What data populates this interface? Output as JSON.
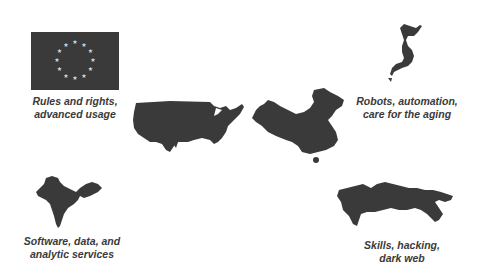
{
  "regions": [
    {
      "id": "eu",
      "symbol": "flag",
      "label": "Rules and rights,\nadvanced usage"
    },
    {
      "id": "usa",
      "symbol": "map",
      "label": ""
    },
    {
      "id": "china",
      "symbol": "map",
      "label": ""
    },
    {
      "id": "japan",
      "symbol": "map",
      "label": "Robots, automation,\ncare for the aging"
    },
    {
      "id": "india",
      "symbol": "map",
      "label": "Software, data, and\nanalytic services"
    },
    {
      "id": "russia",
      "symbol": "map",
      "label": "Skills, hacking,\ndark web"
    }
  ],
  "colors": {
    "shape_fill": "#3a3a3a",
    "text": "#3a3a3a",
    "flag_stars": "#d8d8d8",
    "background": "#ffffff"
  }
}
